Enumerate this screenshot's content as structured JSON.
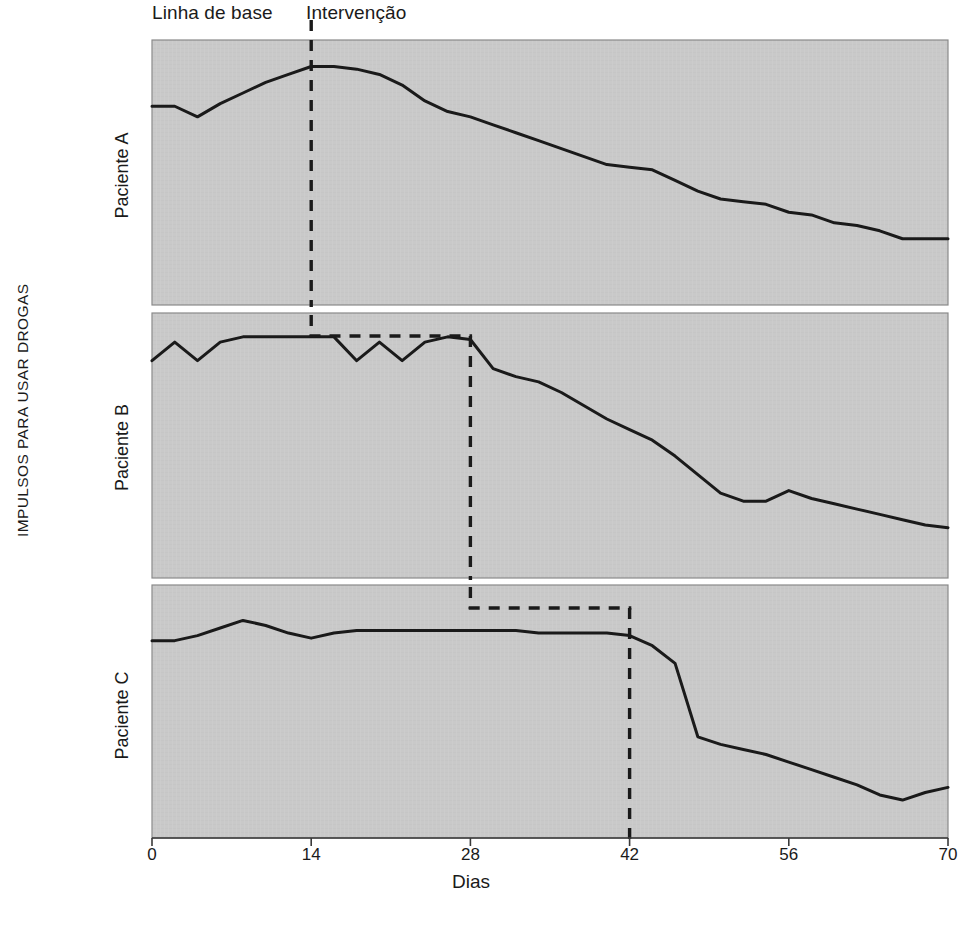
{
  "figure": {
    "phase_labels": {
      "baseline": "Linha de base",
      "intervention": "Intervenção"
    },
    "ylabel": "IMPULSOS PARA USAR DROGAS",
    "xlabel": "Dias",
    "panel_labels": [
      "Paciente A",
      "Paciente B",
      "Paciente C"
    ],
    "colors": {
      "plot_background": "#c9c9c9",
      "line": "#1a1a1a",
      "text": "#1a1a1a",
      "page_background": "#ffffff"
    }
  },
  "chart_data": {
    "type": "line",
    "title": "",
    "xlabel": "Dias",
    "ylabel": "IMPULSOS PARA USAR DROGAS",
    "xlim": [
      0,
      70
    ],
    "ylim": [
      0,
      10
    ],
    "xticks": [
      0,
      14,
      28,
      42,
      56,
      70
    ],
    "xtick_labels": [
      "0",
      "14",
      "28",
      "42",
      "56",
      "70"
    ],
    "yticks": [],
    "grid": false,
    "legend": "none",
    "annotations": [
      {
        "text": "Linha de base",
        "x": 0,
        "position": "above-axis-left"
      },
      {
        "text": "Intervenção",
        "x": 16,
        "position": "above-axis-right"
      }
    ],
    "panels": [
      {
        "name": "Paciente A",
        "intervention_day": 14,
        "x": [
          0,
          2,
          4,
          6,
          8,
          10,
          12,
          14,
          16,
          18,
          20,
          22,
          24,
          26,
          28,
          30,
          32,
          34,
          36,
          38,
          40,
          42,
          44,
          46,
          48,
          50,
          52,
          54,
          56,
          58,
          60,
          62,
          64,
          66,
          68,
          70
        ],
        "y": [
          7.5,
          7.5,
          7.1,
          7.6,
          8.0,
          8.4,
          8.7,
          9.0,
          9.0,
          8.9,
          8.7,
          8.3,
          7.7,
          7.3,
          7.1,
          6.8,
          6.5,
          6.2,
          5.9,
          5.6,
          5.3,
          5.2,
          5.1,
          4.7,
          4.3,
          4.0,
          3.9,
          3.8,
          3.5,
          3.4,
          3.1,
          3.0,
          2.8,
          2.5,
          2.5,
          2.5
        ]
      },
      {
        "name": "Paciente B",
        "intervention_day": 28,
        "x": [
          0,
          2,
          4,
          6,
          8,
          10,
          12,
          14,
          16,
          18,
          20,
          22,
          24,
          26,
          28,
          30,
          32,
          34,
          36,
          38,
          40,
          42,
          44,
          46,
          48,
          50,
          52,
          54,
          56,
          58,
          60,
          62,
          64,
          66,
          68,
          70
        ],
        "y": [
          8.2,
          8.9,
          8.2,
          8.9,
          9.1,
          9.1,
          9.1,
          9.1,
          9.1,
          8.2,
          8.9,
          8.2,
          8.9,
          9.1,
          9.0,
          7.9,
          7.6,
          7.4,
          7.0,
          6.5,
          6.0,
          5.6,
          5.2,
          4.6,
          3.9,
          3.2,
          2.9,
          2.9,
          3.3,
          3.0,
          2.8,
          2.6,
          2.4,
          2.2,
          2.0,
          1.9
        ]
      },
      {
        "name": "Paciente C",
        "intervention_day": 42,
        "x": [
          0,
          2,
          4,
          6,
          8,
          10,
          12,
          14,
          16,
          18,
          20,
          22,
          24,
          26,
          28,
          30,
          32,
          34,
          36,
          38,
          40,
          42,
          44,
          46,
          48,
          50,
          52,
          54,
          56,
          58,
          60,
          62,
          64,
          66,
          68,
          70
        ],
        "y": [
          7.8,
          7.8,
          8.0,
          8.3,
          8.6,
          8.4,
          8.1,
          7.9,
          8.1,
          8.2,
          8.2,
          8.2,
          8.2,
          8.2,
          8.2,
          8.2,
          8.2,
          8.1,
          8.1,
          8.1,
          8.1,
          8.0,
          7.6,
          6.9,
          4.0,
          3.7,
          3.5,
          3.3,
          3.0,
          2.7,
          2.4,
          2.1,
          1.7,
          1.5,
          1.8,
          2.0
        ]
      }
    ]
  }
}
